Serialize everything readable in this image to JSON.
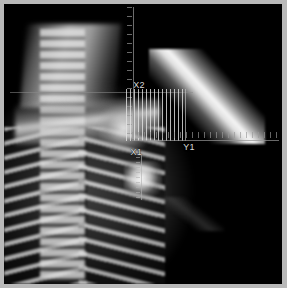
{
  "viewer": {
    "name": "radiograph-measurement-viewer",
    "frame_color": "#b9b9b9",
    "background_color": "#000000",
    "modality": "x-ray"
  },
  "study": {
    "anatomy": [
      "cervical-spine",
      "thoracic-spine",
      "rib-cage",
      "clavicle",
      "shoulder-joint",
      "trachea",
      "mediastinum"
    ],
    "findings": [
      "bright-nodule",
      "radiopaque-instrument"
    ]
  },
  "overlay": {
    "labels": {
      "x1": "X1",
      "x2": "X2",
      "y1": "Y1"
    },
    "elements": [
      "vertical-axis",
      "horizontal-axis",
      "horizontal-ruler",
      "caliper-band",
      "nodule-caliper"
    ],
    "line_color": "#969696",
    "text_color": "#d8d8d8"
  }
}
